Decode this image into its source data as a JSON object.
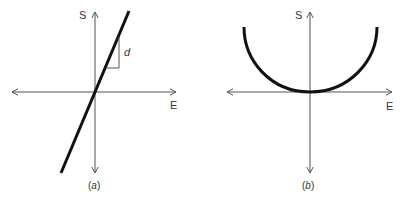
{
  "figure": {
    "panels": [
      {
        "id": "a",
        "caption_open": "(",
        "caption_letter": "a",
        "caption_close": ")",
        "y_axis_label": "S",
        "x_axis_label": "E",
        "annotation": "d",
        "curve": "straight line through origin with positive slope",
        "slope_triangle": true
      },
      {
        "id": "b",
        "caption_open": "(",
        "caption_letter": "b",
        "caption_close": ")",
        "y_axis_label": "S",
        "x_axis_label": "E",
        "curve": "U-shaped parabola with minimum at origin"
      }
    ],
    "colors": {
      "axis": "#555555",
      "curve": "#111111",
      "text": "#333333"
    }
  }
}
